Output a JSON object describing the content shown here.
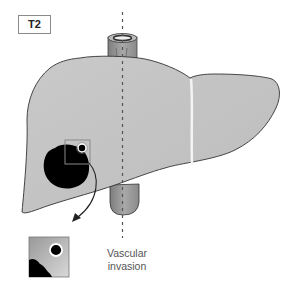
{
  "figure": {
    "stage_label": "T2",
    "caption_line1": "Vascular",
    "caption_line2": "invasion"
  },
  "colors": {
    "liver_fill": "#c4c4c4",
    "liver_outline": "#3a3a3a",
    "tumor": "#000000",
    "vessel_fill": "#9a9a9a",
    "ligament": "#eeeeee",
    "dashed_line": "#555555"
  },
  "elements": [
    {
      "name": "liver",
      "description": "gray liver silhouette with right and left lobes"
    },
    {
      "name": "tumor",
      "description": "black irregular mass in right lobe"
    },
    {
      "name": "vascular-invasion-box",
      "description": "inset square highlighting small vessel invaded"
    },
    {
      "name": "magnified-inset",
      "description": "enlarged view of vessel with tumor below"
    },
    {
      "name": "inferior-vena-cava",
      "description": "tubular vessel above and below liver"
    },
    {
      "name": "midline-dashed",
      "description": "vertical dashed reference line"
    }
  ]
}
